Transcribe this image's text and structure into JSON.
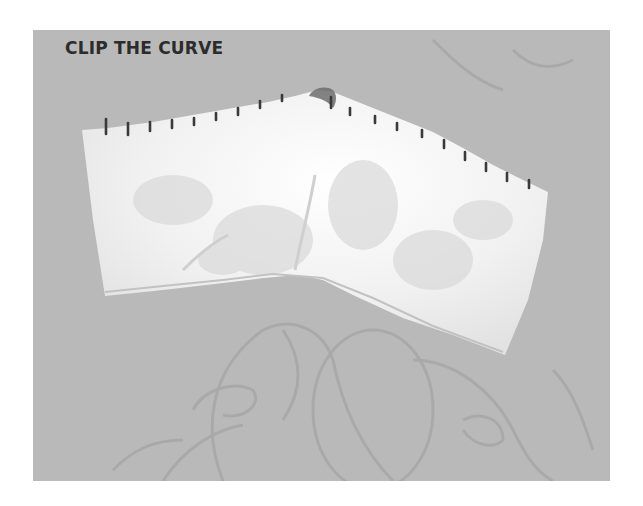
{
  "image": {
    "caption": "CLIP THE CURVE",
    "subject": "white muslin sleeve cap pattern piece with clip notches along its curved top edge, on a grey patterned background",
    "colors": {
      "background": "#b9b9b9",
      "fabric": "#f2f2f2",
      "clip_marks": "#3a3a3a",
      "caption_text": "#2c2c2c",
      "pattern_lines": "#a4a4a4"
    },
    "clip_mark_count": 19
  }
}
